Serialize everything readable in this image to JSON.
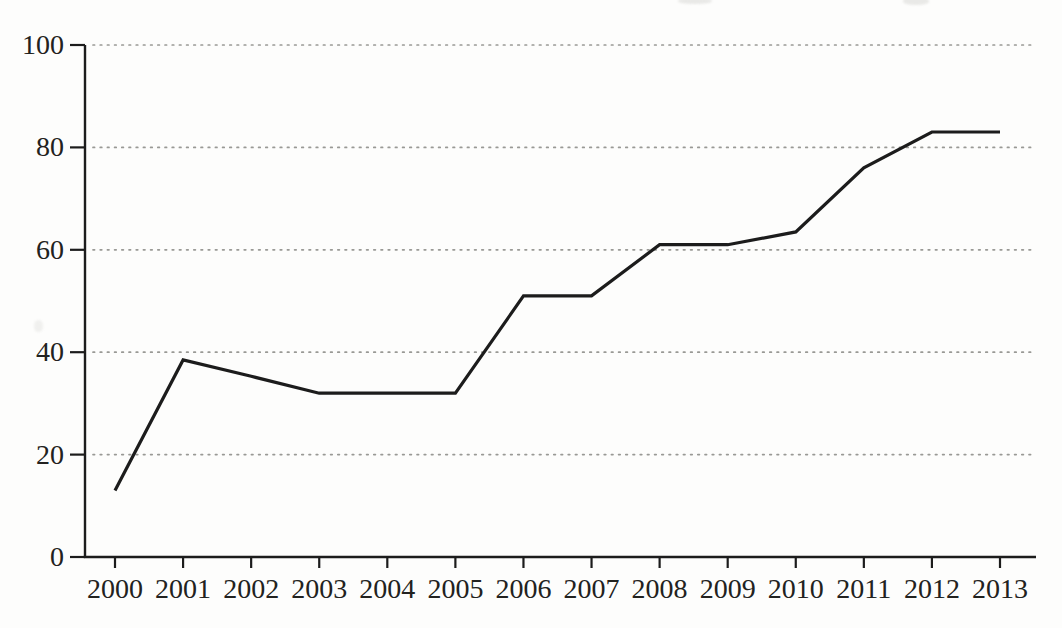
{
  "figure": {
    "background_color": "#fdfdfc",
    "line_color": "#1c1c1c",
    "axis_color": "#1c1c1c",
    "gridline_color": "#999995",
    "label_color": "#222220"
  },
  "chart_data": {
    "type": "line",
    "title": "",
    "xlabel": "",
    "ylabel": "",
    "categories": [
      "2000",
      "2001",
      "2002",
      "2003",
      "2004",
      "2005",
      "2006",
      "2007",
      "2008",
      "2009",
      "2010",
      "2011",
      "2012",
      "2013"
    ],
    "series": [
      {
        "name": "series-1",
        "values": [
          13,
          38.5,
          35.3,
          32,
          32,
          32,
          51,
          51,
          61,
          61,
          63.5,
          76,
          83,
          83
        ]
      }
    ],
    "ylim": [
      0,
      100
    ],
    "yticks": [
      0,
      20,
      40,
      60,
      80,
      100
    ],
    "ytick_labels": [
      "0",
      "20",
      "40",
      "60",
      "80",
      "100"
    ],
    "grid": "horizontal-dotted",
    "legend": "none"
  }
}
